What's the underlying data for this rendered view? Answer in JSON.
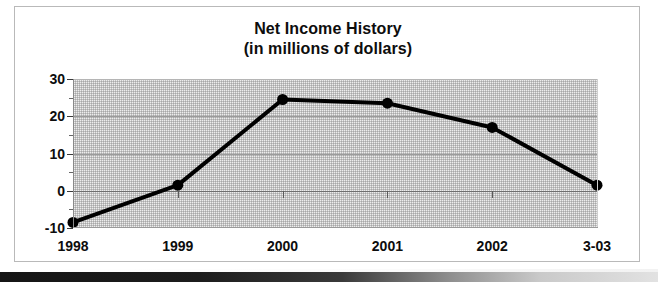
{
  "figure": {
    "frame_border_color": "#b9b9b9",
    "background_color": "#ffffff"
  },
  "title": {
    "line1": "Net Income History",
    "line2": "(in millions of dollars)"
  },
  "axis": {
    "y_tick_labels": [
      "30",
      "20",
      "10",
      "0",
      "-10"
    ],
    "x_tick_labels": [
      "1998",
      "1999",
      "2000",
      "2001",
      "2002",
      "3-03"
    ]
  },
  "chart_data": {
    "type": "line",
    "title": "Net Income History (in millions of dollars)",
    "subtitle": "(in millions of dollars)",
    "xlabel": "",
    "ylabel": "",
    "categories": [
      "1998",
      "1999",
      "2000",
      "2001",
      "2002",
      "3-03"
    ],
    "values": [
      -8.5,
      1.5,
      24.5,
      23.5,
      17.0,
      1.5
    ],
    "series": [
      {
        "name": "Net Income",
        "values": [
          -8.5,
          1.5,
          24.5,
          23.5,
          17.0,
          1.5
        ]
      }
    ],
    "ylim": [
      -10,
      30
    ],
    "y_major_ticks": [
      30,
      20,
      10,
      0,
      -10
    ],
    "y_minor_ticks": [
      25,
      15,
      5,
      -5
    ],
    "grid": true,
    "legend": false,
    "legend_position": "none",
    "line_color": "#000000",
    "line_width": 4,
    "marker": "circle",
    "marker_size": 11,
    "plot_background": "#ededed",
    "units": "millions of dollars",
    "zero_line": 0,
    "annotations": []
  }
}
